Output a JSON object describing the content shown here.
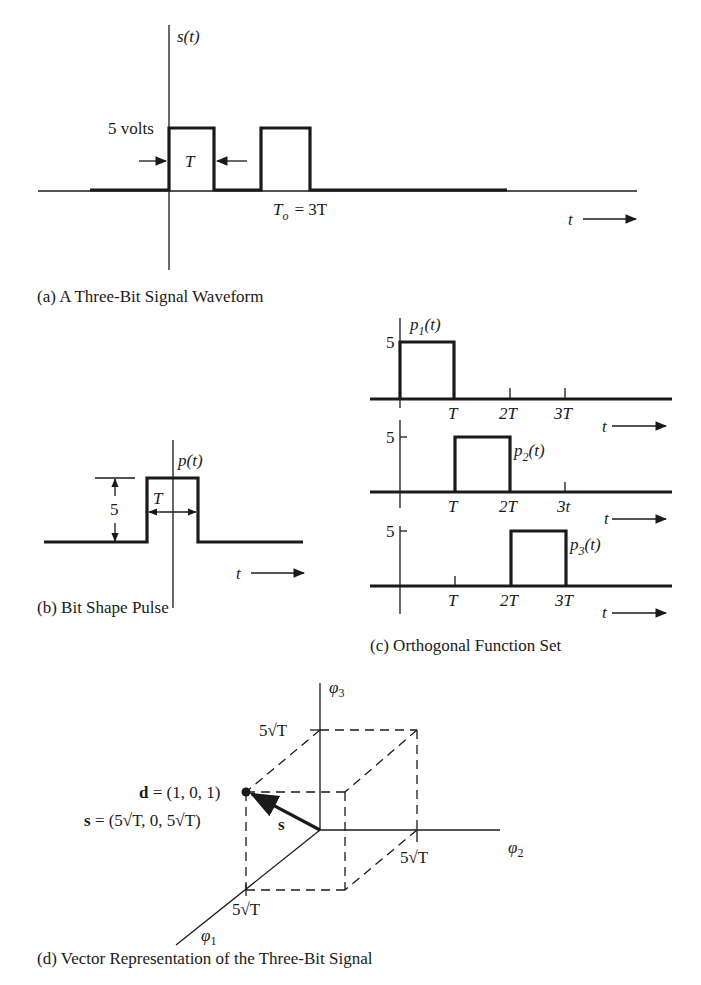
{
  "panel_a": {
    "caption": "(a)  A Three-Bit Signal Waveform",
    "y_axis_label": "s(t)",
    "amplitude_label": "5 volts",
    "width_label": "T",
    "period_label_T": "T",
    "period_label_sub": "o",
    "period_label_rest": "= 3T",
    "x_axis_label": "t"
  },
  "panel_b": {
    "caption": "(b)  Bit Shape Pulse",
    "y_axis_label": "p(t)",
    "amplitude_label": "5",
    "width_label": "T",
    "x_axis_label": "t"
  },
  "panel_c": {
    "caption": "(c)  Orthogonal Function Set",
    "functions": [
      {
        "name": "p",
        "sub": "1",
        "arg": "(t)",
        "amplitude": "5",
        "ticks": [
          "T",
          "2T",
          "3T"
        ],
        "x_axis_label": "t"
      },
      {
        "name": "p",
        "sub": "2",
        "arg": "(t)",
        "amplitude": "5",
        "ticks": [
          "T",
          "2T",
          "3t"
        ],
        "x_axis_label": "t"
      },
      {
        "name": "p",
        "sub": "3",
        "arg": "(t)",
        "amplitude": "5",
        "ticks": [
          "T",
          "2T",
          "3T"
        ],
        "x_axis_label": "t"
      }
    ]
  },
  "panel_d": {
    "caption": "(d)  Vector Representation of the Three-Bit Signal",
    "axis_phi3": {
      "sym": "φ",
      "sub": "3"
    },
    "axis_phi2": {
      "sym": "φ",
      "sub": "2"
    },
    "axis_phi1": {
      "sym": "φ",
      "sub": "1"
    },
    "tick_phi3": "5√T",
    "tick_phi2": "5√T",
    "tick_phi1": "5√T",
    "d_bold": "d",
    "d_value": " = (1, 0, 1)",
    "s_bold": "s",
    "s_value": " = (5√T, 0, 5√T)",
    "vector_label": "s"
  }
}
